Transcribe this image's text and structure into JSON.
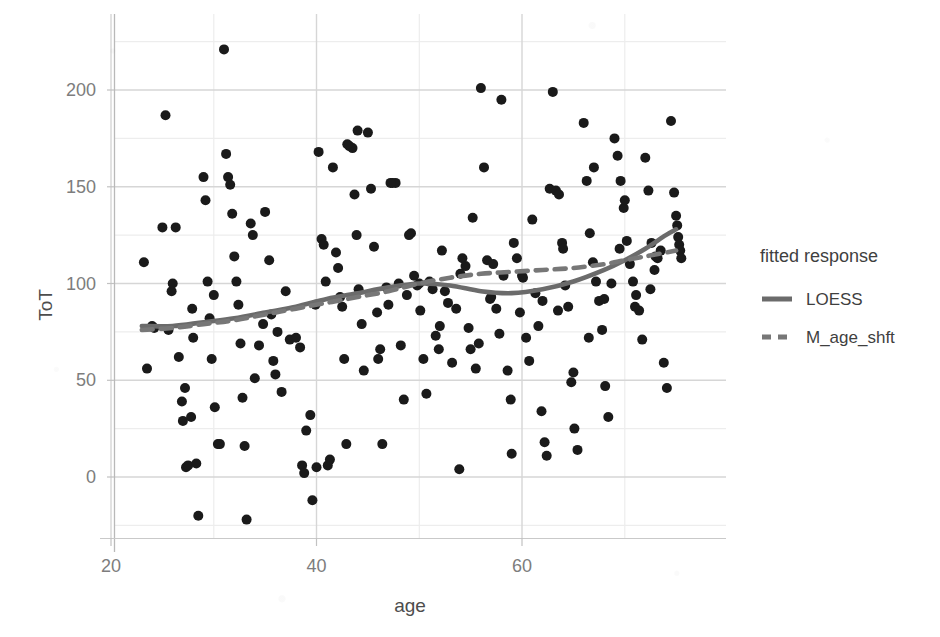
{
  "chart_data": {
    "type": "scatter",
    "title": "",
    "subtitle": "",
    "xlabel": "age",
    "ylabel": "ToT",
    "xlim": [
      22,
      76
    ],
    "ylim": [
      -28,
      230
    ],
    "xticks": [
      20,
      40,
      60
    ],
    "yticks": [
      0,
      50,
      100,
      150,
      200
    ],
    "xticklabels": [
      "20",
      "40",
      "60"
    ],
    "yticklabels": [
      "0",
      "50",
      "100",
      "150",
      "200"
    ],
    "grid": true,
    "grid_minor": true,
    "point_color": "#1a1a1a",
    "point_size": 5,
    "legend": {
      "title": "fitted response",
      "position": "right",
      "entries": [
        {
          "name": "LOESS",
          "style": "solid",
          "color": "#6b6b6b"
        },
        {
          "name": "M_age_shft",
          "style": "dashed",
          "color": "#777777"
        }
      ]
    },
    "points": [
      [
        23.2,
        111
      ],
      [
        23.5,
        56
      ],
      [
        24.0,
        78
      ],
      [
        24.2,
        77
      ],
      [
        25.0,
        129
      ],
      [
        25.3,
        187
      ],
      [
        25.6,
        76
      ],
      [
        25.9,
        96
      ],
      [
        26.3,
        129
      ],
      [
        26.6,
        62
      ],
      [
        26.9,
        39
      ],
      [
        27.0,
        29
      ],
      [
        27.2,
        46
      ],
      [
        27.3,
        5
      ],
      [
        27.5,
        6
      ],
      [
        27.8,
        31
      ],
      [
        27.9,
        87
      ],
      [
        28.0,
        72
      ],
      [
        28.3,
        7
      ],
      [
        28.5,
        -20
      ],
      [
        29.0,
        155
      ],
      [
        29.2,
        143
      ],
      [
        29.4,
        101
      ],
      [
        29.6,
        82
      ],
      [
        29.8,
        61
      ],
      [
        30.1,
        36
      ],
      [
        30.4,
        17
      ],
      [
        30.6,
        17
      ],
      [
        31.0,
        221
      ],
      [
        31.2,
        167
      ],
      [
        31.4,
        155
      ],
      [
        31.6,
        151
      ],
      [
        31.8,
        136
      ],
      [
        32.0,
        114
      ],
      [
        32.2,
        101
      ],
      [
        32.4,
        89
      ],
      [
        32.6,
        69
      ],
      [
        32.8,
        41
      ],
      [
        33.0,
        16
      ],
      [
        33.2,
        -22
      ],
      [
        33.6,
        131
      ],
      [
        34.0,
        51
      ],
      [
        34.4,
        68
      ],
      [
        34.8,
        79
      ],
      [
        35.0,
        137
      ],
      [
        35.4,
        112
      ],
      [
        35.6,
        84
      ],
      [
        35.8,
        60
      ],
      [
        36.2,
        75
      ],
      [
        36.6,
        44
      ],
      [
        37.0,
        96
      ],
      [
        37.4,
        71
      ],
      [
        38.0,
        72
      ],
      [
        38.4,
        67
      ],
      [
        38.6,
        6
      ],
      [
        38.8,
        2
      ],
      [
        39.0,
        24
      ],
      [
        39.4,
        32
      ],
      [
        39.6,
        -12
      ],
      [
        39.9,
        89
      ],
      [
        40.2,
        168
      ],
      [
        40.5,
        123
      ],
      [
        40.7,
        120
      ],
      [
        40.9,
        101
      ],
      [
        41.1,
        6
      ],
      [
        41.3,
        9
      ],
      [
        41.6,
        160
      ],
      [
        41.9,
        116
      ],
      [
        42.1,
        108
      ],
      [
        42.3,
        93
      ],
      [
        42.5,
        88
      ],
      [
        42.7,
        61
      ],
      [
        42.9,
        17
      ],
      [
        43.2,
        171
      ],
      [
        43.5,
        170
      ],
      [
        43.7,
        146
      ],
      [
        43.9,
        125
      ],
      [
        44.1,
        97
      ],
      [
        44.4,
        79
      ],
      [
        44.6,
        55
      ],
      [
        45.0,
        178
      ],
      [
        45.3,
        149
      ],
      [
        45.6,
        119
      ],
      [
        45.9,
        85
      ],
      [
        46.2,
        66
      ],
      [
        46.4,
        17
      ],
      [
        46.8,
        98
      ],
      [
        47.0,
        89
      ],
      [
        47.4,
        152
      ],
      [
        47.7,
        152
      ],
      [
        48.0,
        100
      ],
      [
        48.2,
        68
      ],
      [
        48.5,
        40
      ],
      [
        48.8,
        94
      ],
      [
        49.2,
        126
      ],
      [
        49.5,
        104
      ],
      [
        49.8,
        99
      ],
      [
        50.1,
        86
      ],
      [
        50.4,
        61
      ],
      [
        50.7,
        43
      ],
      [
        51.0,
        101
      ],
      [
        51.3,
        97
      ],
      [
        51.6,
        73
      ],
      [
        51.9,
        66
      ],
      [
        52.2,
        117
      ],
      [
        52.5,
        96
      ],
      [
        52.8,
        90
      ],
      [
        53.2,
        59
      ],
      [
        53.6,
        87
      ],
      [
        53.9,
        4
      ],
      [
        54.2,
        113
      ],
      [
        54.5,
        109
      ],
      [
        54.8,
        77
      ],
      [
        55.2,
        134
      ],
      [
        55.5,
        56
      ],
      [
        55.8,
        69
      ],
      [
        56.0,
        201
      ],
      [
        56.3,
        160
      ],
      [
        56.6,
        112
      ],
      [
        56.9,
        92
      ],
      [
        57.2,
        110
      ],
      [
        57.5,
        87
      ],
      [
        57.8,
        74
      ],
      [
        58.2,
        104
      ],
      [
        58.6,
        55
      ],
      [
        58.9,
        40
      ],
      [
        59.2,
        121
      ],
      [
        59.5,
        113
      ],
      [
        59.8,
        85
      ],
      [
        60.1,
        103
      ],
      [
        60.4,
        72
      ],
      [
        60.7,
        60
      ],
      [
        61.0,
        133
      ],
      [
        61.3,
        95
      ],
      [
        61.6,
        78
      ],
      [
        61.9,
        34
      ],
      [
        62.2,
        18
      ],
      [
        62.4,
        11
      ],
      [
        62.7,
        149
      ],
      [
        63.0,
        199
      ],
      [
        63.3,
        148
      ],
      [
        63.6,
        146
      ],
      [
        63.9,
        121
      ],
      [
        64.2,
        99
      ],
      [
        64.5,
        88
      ],
      [
        64.8,
        49
      ],
      [
        65.1,
        25
      ],
      [
        65.4,
        14
      ],
      [
        66.0,
        183
      ],
      [
        66.3,
        153
      ],
      [
        66.6,
        126
      ],
      [
        66.9,
        111
      ],
      [
        67.2,
        101
      ],
      [
        67.5,
        91
      ],
      [
        67.8,
        76
      ],
      [
        68.1,
        47
      ],
      [
        68.4,
        31
      ],
      [
        68.7,
        100
      ],
      [
        69.0,
        175
      ],
      [
        69.3,
        166
      ],
      [
        69.6,
        153
      ],
      [
        69.9,
        139
      ],
      [
        70.2,
        122
      ],
      [
        70.5,
        110
      ],
      [
        70.8,
        101
      ],
      [
        71.1,
        94
      ],
      [
        71.4,
        86
      ],
      [
        71.7,
        71
      ],
      [
        72.0,
        165
      ],
      [
        72.3,
        148
      ],
      [
        72.6,
        121
      ],
      [
        72.9,
        107
      ],
      [
        73.2,
        113
      ],
      [
        73.5,
        117
      ],
      [
        73.8,
        59
      ],
      [
        74.1,
        46
      ],
      [
        74.5,
        184
      ],
      [
        74.8,
        147
      ],
      [
        75.0,
        135
      ],
      [
        75.1,
        130
      ],
      [
        75.2,
        124
      ],
      [
        75.3,
        120
      ],
      [
        75.4,
        117
      ],
      [
        75.5,
        113
      ],
      [
        26.0,
        100
      ],
      [
        30.0,
        94
      ],
      [
        33.8,
        125
      ],
      [
        36.0,
        53
      ],
      [
        44.0,
        179
      ],
      [
        47.2,
        152
      ],
      [
        50.0,
        100
      ],
      [
        54.0,
        105
      ],
      [
        57.0,
        93
      ],
      [
        60.0,
        104
      ],
      [
        64.0,
        118
      ],
      [
        68.0,
        92
      ],
      [
        71.0,
        88
      ],
      [
        73.0,
        114
      ],
      [
        58.0,
        195
      ],
      [
        62.0,
        91
      ],
      [
        65.0,
        54
      ],
      [
        66.5,
        72
      ],
      [
        69.5,
        118
      ],
      [
        72.5,
        97
      ],
      [
        40.0,
        5
      ],
      [
        43.0,
        172
      ],
      [
        46.0,
        61
      ],
      [
        49.0,
        125
      ],
      [
        52.0,
        78
      ],
      [
        55.0,
        66
      ],
      [
        59.0,
        12
      ],
      [
        63.5,
        86
      ],
      [
        67.0,
        160
      ],
      [
        70.0,
        143
      ]
    ],
    "series": [
      {
        "name": "LOESS",
        "style": "solid",
        "color": "#6b6b6b",
        "x": [
          23,
          26,
          29,
          32,
          35,
          38,
          41,
          44,
          47,
          50,
          53,
          56,
          59,
          62,
          65,
          68,
          70,
          72,
          74,
          75
        ],
        "y": [
          78,
          78,
          80,
          82,
          85,
          88,
          92,
          95,
          98,
          100,
          99,
          96,
          95,
          97,
          101,
          107,
          112,
          118,
          125,
          128
        ]
      },
      {
        "name": "M_age_shft",
        "style": "dashed",
        "color": "#777777",
        "x": [
          23,
          26,
          29,
          32,
          35,
          38,
          41,
          44,
          47,
          50,
          53,
          56,
          59,
          62,
          65,
          68,
          70,
          72,
          74,
          75
        ],
        "y": [
          76,
          77,
          79,
          81,
          84,
          87,
          90,
          93,
          96,
          100,
          103,
          105,
          106,
          107,
          108,
          110,
          112,
          114,
          116,
          117
        ]
      }
    ]
  }
}
